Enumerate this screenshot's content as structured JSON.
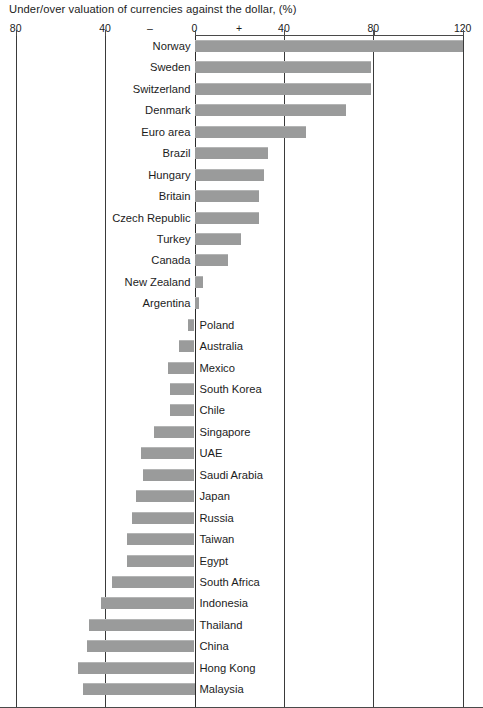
{
  "chart_data": {
    "type": "bar",
    "orientation": "horizontal",
    "title": "Under/over valuation of currencies against the dollar, (%)",
    "xlabel": "",
    "ylabel": "",
    "xlim": [
      -80,
      120
    ],
    "grid": true,
    "legend": "none",
    "axis_ticks": [
      {
        "label": "80",
        "value": -80
      },
      {
        "label": "40",
        "value": -40
      },
      {
        "label": "–",
        "value": -20
      },
      {
        "label": "0",
        "value": 0
      },
      {
        "label": "+",
        "value": 20
      },
      {
        "label": "40",
        "value": 40
      },
      {
        "label": "80",
        "value": 80
      },
      {
        "label": "120",
        "value": 120
      }
    ],
    "bar_color": "#9a9b9b",
    "categories": [
      "Norway",
      "Sweden",
      "Switzerland",
      "Denmark",
      "Euro area",
      "Brazil",
      "Hungary",
      "Britain",
      "Czech Republic",
      "Turkey",
      "Canada",
      "New Zealand",
      "Argentina",
      "Poland",
      "Australia",
      "Mexico",
      "South Korea",
      "Chile",
      "Singapore",
      "UAE",
      "Saudi Arabia",
      "Japan",
      "Russia",
      "Taiwan",
      "Egypt",
      "South Africa",
      "Indonesia",
      "Thailand",
      "China",
      "Hong Kong",
      "Malaysia"
    ],
    "values": [
      120,
      79,
      79,
      68,
      50,
      33,
      31,
      29,
      29,
      21,
      15,
      4,
      2,
      -3,
      -7,
      -12,
      -11,
      -11,
      -18,
      -24,
      -23,
      -26,
      -28,
      -30,
      -30,
      -37,
      -42,
      -47,
      -48,
      -52,
      -50
    ]
  }
}
